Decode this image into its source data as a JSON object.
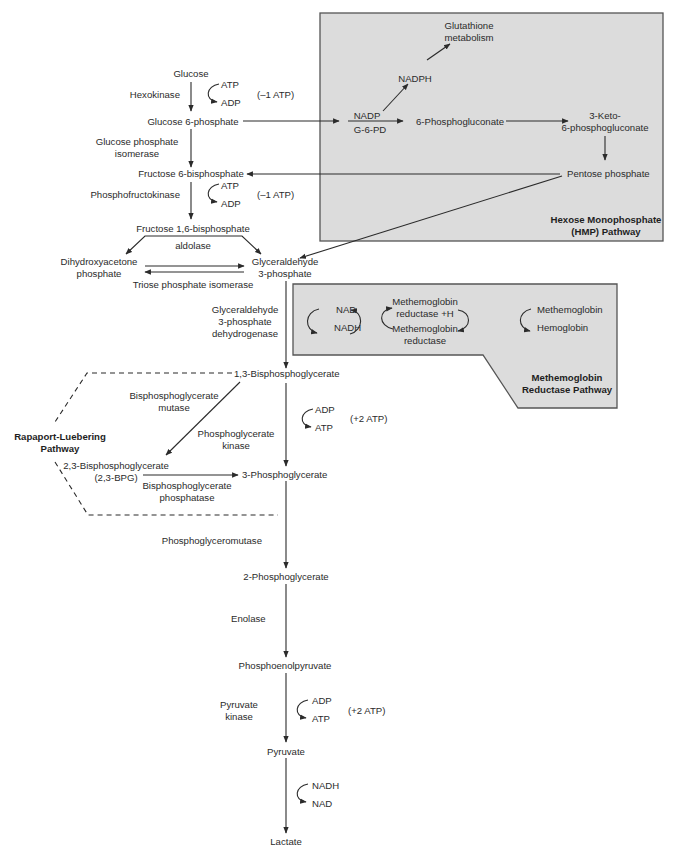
{
  "colors": {
    "box_fill": "#dcdcdc",
    "box_stroke": "#555555",
    "line": "#2b2b2b",
    "background": "#ffffff"
  },
  "glycolysis": {
    "glucose": "Glucose",
    "hexokinase": "Hexokinase",
    "atp1": "ATP",
    "adp1": "ADP",
    "net1": "(–1 ATP)",
    "g6p": "Glucose 6-phosphate",
    "gpi_1": "Glucose phosphate",
    "gpi_2": "isomerase",
    "f6p": "Fructose 6-bisphosphate",
    "pfk": "Phosphofructokinase",
    "atp2": "ATP",
    "adp2": "ADP",
    "net2": "(–1 ATP)",
    "f16bp": "Fructose 1,6-bisphosphate",
    "aldolase": "aldolase",
    "dhap_1": "Dihydroxyacetone",
    "dhap_2": "phosphate",
    "g3p_1": "Glyceraldehyde",
    "g3p_2": "3-phosphate",
    "tpi": "Triose phosphate isomerase",
    "gapdh_1": "Glyceraldehyde",
    "gapdh_2": "3-phosphate",
    "gapdh_3": "dehydrogenase",
    "bpg13": "1,3-Bisphosphoglycerate",
    "adp3": "ADP",
    "atp3": "ATP",
    "net3": "(+2 ATP)",
    "pgk_1": "Phosphoglycerate",
    "pgk_2": "kinase",
    "pg3": "3-Phosphoglycerate",
    "pgm": "Phosphoglyceromutase",
    "pg2": "2-Phosphoglycerate",
    "enolase": "Enolase",
    "pep": "Phosphoenolpyruvate",
    "pk_1": "Pyruvate",
    "pk_2": "kinase",
    "adp4": "ADP",
    "atp4": "ATP",
    "net4": "(+2 ATP)",
    "pyruvate": "Pyruvate",
    "nadh": "NADH",
    "nad": "NAD",
    "lactate": "Lactate"
  },
  "hmp": {
    "glutathione_1": "Glutathione",
    "glutathione_2": "metabolism",
    "nadph": "NADPH",
    "nadp": "NADP",
    "g6pd": "G-6-PD",
    "pg6": "6-Phosphogluconate",
    "keto_1": "3-Keto-",
    "keto_2": "6-phosphogluconate",
    "pentose": "Pentose phosphate",
    "title_1": "Hexose Monophosphate",
    "title_2": "(HMP) Pathway"
  },
  "methemoglobin": {
    "nad": "NAD",
    "nadh": "NADH",
    "mr_h_1": "Methemoglobin",
    "mr_h_2": "reductase +H",
    "mr_1": "Methemoglobin",
    "mr_2": "reductase",
    "methb": "Methemoglobin",
    "hb": "Hemoglobin",
    "title_1": "Methemoglobin",
    "title_2": "Reductase Pathway"
  },
  "rapoport": {
    "title_1": "Rapaport-Luebering",
    "title_2": "Pathway",
    "mutase_1": "Bisphosphoglycerate",
    "mutase_2": "mutase",
    "bpg23_1": "2,3-Bisphosphoglycerate",
    "bpg23_2": "(2,3-BPG)",
    "phosphatase_1": "Bisphosphoglycerate",
    "phosphatase_2": "phosphatase"
  }
}
